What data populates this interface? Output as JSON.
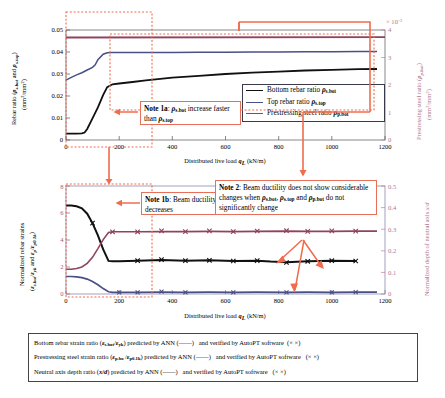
{
  "figure": {
    "xlabel_html": "Distributed live load <b><i>q</i><span class=\"sub\">L</span></b> (kN/m)"
  },
  "top_chart": {
    "ylabel_line1": "Rebar ratio (ρs.bot and ρs.top)",
    "ylabel_line2": "(mm²/mm²)",
    "ylabel_right_line1": "Prestressing steel ratio (ρp.bot)",
    "ylabel_right_line2": "(mm²/mm²)",
    "right_exponent": "× 10⁻³",
    "xticks": [
      "0",
      "200",
      "400",
      "600",
      "800",
      "1000",
      "1200"
    ],
    "yticks_left": [
      "0",
      "0.01",
      "0.02",
      "0.03",
      "0.04",
      "0.05"
    ],
    "yticks_right": [
      "0",
      "1",
      "2",
      "3",
      "4"
    ],
    "legend": [
      {
        "label_html": "Bottom rebar ratio <b><i>ρ</i><span class=\"sub\">s.bot</span></b>",
        "color": "#111111",
        "name": "bottom-rebar-ratio"
      },
      {
        "label_html": "Top rebar ratio <b><i>ρ</i><span class=\"sub\">s.top</span></b>",
        "color": "#4a4f86",
        "name": "top-rebar-ratio"
      },
      {
        "label_html": "Prestressing steel ratio <b><i>ρ</i><span class=\"sub\">p.bot</span></b>",
        "color": "#8f4360",
        "name": "prestressing-steel-ratio"
      }
    ]
  },
  "bottom_chart": {
    "ylabel_line1": "Normalized rebar strains",
    "ylabel_line2": "(εs.bot/εyk and εp/εp0.1k)",
    "ylabel_right": "Normalized depth of neutral axis x/d",
    "xticks": [
      "0",
      "200",
      "400",
      "600",
      "800",
      "1000",
      "1200"
    ],
    "yticks_left": [
      "0",
      "2",
      "4",
      "6",
      "8"
    ],
    "yticks_right": [
      "0",
      "0.1",
      "0.2",
      "0.3",
      "0.4",
      "0.5"
    ]
  },
  "notes": {
    "note1a_html": "<b>Note 1a</b>: <b><i>ρ</i><span class=\"sub\">s.bot</span></b> increase faster than <b><i>ρ</i><span class=\"sub\">s.top</span></b>",
    "note1b_html": "<b>Note 1b</b>: Beam ductility decreases",
    "note2_html": "<b>Note 2</b>: Beam ductility does not show considerable changes when <b><i>ρ</i><span class=\"sub\">s.bot</span></b>, <b><i>ρ</i><span class=\"sub\">s.top</span></b> and <b><i>ρ</i><span class=\"sub\">p.bot</span></b> do not significantly change"
  },
  "caption": {
    "lines_html": [
      "Bottom rebar strain ratio (<b><i>ε</i><span class=\"sub\">s.bot</span></b>/<b><i>ε</i><span class=\"sub\">yk</span></b>) predicted by ANN (——)&nbsp;&nbsp; and verified by AutoPT software&nbsp; (×&nbsp;×)",
      "Prestressing steel strain ratio (<b><i>ε</i><span class=\"sub\">p.bo</span></b>&thinsp;/<b><i>ε</i><span class=\"sub\">p0.1k</span></b>) predicted by ANN (——)&nbsp;&nbsp; and verified by AutoPT software&nbsp;&nbsp; (×&nbsp;×)",
      "Neutral axis depth ratio (<b><i>x</i>/<i>d</i></b>) predicted by ANN (——)&nbsp;&nbsp; and verified by AutoPT software&nbsp;&nbsp; (×&nbsp;×)"
    ]
  },
  "colors": {
    "black": "#111111",
    "blue": "#4a4f86",
    "magenta": "#8f4360",
    "annotation_red": "#ef6c4d",
    "axis_right_pink": "#c08099"
  },
  "chart_data": [
    {
      "type": "line",
      "id": "top",
      "title": "",
      "xlabel": "Distributed live load qL (kN/m)",
      "ylabel": "Rebar ratio (ρs.bot and ρs.top) (mm2/mm2)",
      "ylabel_right": "Prestressing steel ratio (ρp.bot) (mm2/mm2) ×10^-3",
      "xlim": [
        0,
        1200
      ],
      "ylim": [
        0,
        0.05
      ],
      "ylim_right": [
        0,
        0.004
      ],
      "grid": false,
      "legend_position": "lower-right",
      "series": [
        {
          "name": "Bottom rebar ratio ρs.bot",
          "color": "#111111",
          "axis": "left",
          "x": [
            0,
            20,
            40,
            60,
            70,
            80,
            100,
            120,
            140,
            155,
            175,
            200,
            250,
            300,
            400,
            500,
            600,
            700,
            800,
            900,
            1000,
            1100
          ],
          "values": [
            0.0029,
            0.0029,
            0.0029,
            0.003,
            0.0034,
            0.005,
            0.0098,
            0.0148,
            0.0205,
            0.024,
            0.0253,
            0.0257,
            0.0264,
            0.0271,
            0.0283,
            0.0292,
            0.03,
            0.0306,
            0.0311,
            0.0316,
            0.0319,
            0.0322
          ]
        },
        {
          "name": "Top rebar ratio ρs.top",
          "color": "#4a4f86",
          "axis": "left",
          "x": [
            0,
            20,
            40,
            60,
            80,
            100,
            110,
            120,
            140,
            155,
            175,
            200,
            300,
            400,
            500,
            600,
            700,
            800,
            900,
            1000,
            1100
          ],
          "values": [
            0.0272,
            0.0285,
            0.0296,
            0.0306,
            0.0318,
            0.033,
            0.0342,
            0.0365,
            0.039,
            0.0397,
            0.0398,
            0.0398,
            0.0398,
            0.0398,
            0.0399,
            0.0399,
            0.04,
            0.04,
            0.0401,
            0.0401,
            0.0402
          ]
        },
        {
          "name": "Prestressing steel ratio ρp.bot",
          "color": "#8f4360",
          "axis": "right",
          "x": [
            0,
            200,
            400,
            600,
            800,
            1000,
            1100
          ],
          "values": [
            0.00373,
            0.00373,
            0.00373,
            0.00373,
            0.00373,
            0.00373,
            0.00374
          ]
        }
      ]
    },
    {
      "type": "line",
      "id": "bottom",
      "title": "",
      "xlabel": "Distributed live load qL (kN/m)",
      "ylabel": "Normalized rebar strains (εs.bot/εyk and εp/εp0.1k)",
      "ylabel_right": "Normalized depth of neutral axis x/d",
      "xlim": [
        0,
        1200
      ],
      "ylim": [
        0,
        8
      ],
      "ylim_right": [
        0,
        0.5
      ],
      "grid": false,
      "series": [
        {
          "name": "Bottom rebar strain ratio εs.bot/εyk",
          "color": "#111111",
          "axis": "left",
          "marker": "x",
          "x": [
            0,
            20,
            40,
            60,
            80,
            100,
            120,
            140,
            160,
            175,
            200,
            270,
            360,
            450,
            540,
            630,
            720,
            770,
            830,
            910,
            1000,
            1090
          ],
          "values": [
            6.55,
            6.55,
            6.5,
            6.35,
            5.95,
            5.25,
            4.35,
            3.3,
            2.45,
            2.42,
            2.42,
            2.47,
            2.52,
            2.47,
            2.5,
            2.45,
            2.46,
            2.4,
            2.36,
            2.42,
            2.47,
            2.45
          ],
          "marker_x": [
            100,
            270,
            360,
            450,
            540,
            630,
            720,
            830,
            910,
            1000,
            1090
          ],
          "marker_values": [
            5.25,
            2.47,
            2.55,
            2.47,
            2.5,
            2.45,
            2.48,
            2.35,
            2.42,
            2.47,
            2.45
          ]
        },
        {
          "name": "Prestressing steel strain ratio εp/εp0.1k",
          "color": "#4a4f86",
          "axis": "left",
          "marker": "x",
          "x": [
            0,
            20,
            40,
            60,
            80,
            100,
            120,
            140,
            160,
            175,
            200,
            270,
            360,
            450,
            540,
            630,
            720,
            830,
            910,
            1000,
            1090
          ],
          "values": [
            1.3,
            1.3,
            1.28,
            1.22,
            1.1,
            0.92,
            0.68,
            0.4,
            0.16,
            0.13,
            0.12,
            0.12,
            0.12,
            0.12,
            0.12,
            0.12,
            0.12,
            0.12,
            0.12,
            0.12,
            0.12
          ],
          "marker_x": [
            200,
            270,
            360,
            450,
            540,
            630,
            720,
            830,
            910,
            1000,
            1090
          ],
          "marker_values": [
            0.12,
            0.12,
            0.12,
            0.12,
            0.12,
            0.12,
            0.12,
            0.12,
            0.12,
            0.12,
            0.12
          ]
        },
        {
          "name": "Neutral axis depth ratio x/d",
          "color": "#8f4360",
          "axis": "right",
          "marker": "x",
          "x": [
            0,
            20,
            40,
            60,
            80,
            100,
            120,
            140,
            160,
            175,
            200,
            270,
            360,
            450,
            540,
            630,
            720,
            830,
            910,
            1000,
            1090
          ],
          "values": [
            0.115,
            0.115,
            0.118,
            0.125,
            0.142,
            0.17,
            0.21,
            0.252,
            0.285,
            0.288,
            0.288,
            0.289,
            0.289,
            0.289,
            0.29,
            0.289,
            0.29,
            0.291,
            0.29,
            0.29,
            0.291
          ],
          "marker_x": [
            175,
            270,
            360,
            450,
            540,
            630,
            720,
            830,
            910,
            1000,
            1090
          ],
          "marker_values": [
            0.288,
            0.288,
            0.291,
            0.289,
            0.291,
            0.289,
            0.29,
            0.292,
            0.29,
            0.29,
            0.291
          ]
        }
      ]
    }
  ]
}
